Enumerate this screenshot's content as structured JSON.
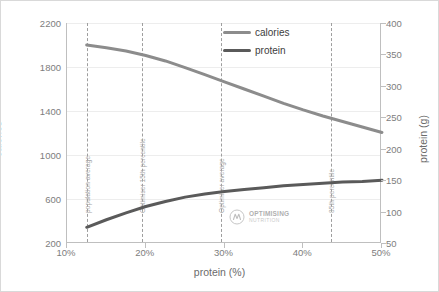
{
  "chart_data": {
    "type": "line",
    "title": "",
    "xlabel": "protein (%)",
    "ylabel": "calories",
    "y2label": "protein (g)",
    "xlim": [
      10,
      50
    ],
    "ylim": [
      200,
      2200
    ],
    "y2lim": [
      50,
      400
    ],
    "grid": true,
    "legend_position": "top-center",
    "x_ticks": [
      "10%",
      "20%",
      "30%",
      "40%",
      "50%"
    ],
    "x_tick_values": [
      10,
      20,
      30,
      40,
      50
    ],
    "y_ticks": [
      "200",
      "600",
      "1000",
      "1400",
      "1800",
      "2200"
    ],
    "y_tick_values": [
      200,
      600,
      1000,
      1400,
      1800,
      2200
    ],
    "y2_ticks": [
      "50",
      "100",
      "150",
      "200",
      "250",
      "300",
      "350",
      "400"
    ],
    "y2_tick_values": [
      50,
      100,
      150,
      200,
      250,
      300,
      350,
      400
    ],
    "series": [
      {
        "name": "calories",
        "axis": "left",
        "color": "#8c8c8c",
        "x": [
          12.5,
          15,
          17.5,
          20,
          22.5,
          25,
          27.5,
          30,
          32.5,
          35,
          37.5,
          40,
          42.5,
          45,
          47.5,
          50
        ],
        "values": [
          2000,
          1975,
          1945,
          1905,
          1855,
          1795,
          1730,
          1665,
          1600,
          1535,
          1470,
          1410,
          1355,
          1305,
          1255,
          1205
        ]
      },
      {
        "name": "protein",
        "axis": "right",
        "color": "#5a5a5a",
        "x": [
          12.5,
          15,
          17.5,
          20,
          22.5,
          25,
          27.5,
          30,
          32.5,
          35,
          37.5,
          40,
          42.5,
          45,
          47.5,
          50
        ],
        "values": [
          75,
          87,
          98,
          108,
          116,
          123,
          128,
          132,
          135,
          138,
          141,
          143,
          145,
          147,
          148,
          150
        ]
      }
    ],
    "annotations": [
      {
        "label": "population average",
        "x": 12.5
      },
      {
        "label": "Optimiser 15th percentile",
        "x": 19.5
      },
      {
        "label": "Optimiser average",
        "x": 29.5
      },
      {
        "label": "85th percentile",
        "x": 43.5
      }
    ]
  },
  "legend": {
    "items": [
      {
        "label": "calories",
        "color": "#8c8c8c"
      },
      {
        "label": "protein",
        "color": "#5a5a5a"
      }
    ]
  },
  "watermark": {
    "main": "OPTIMISING",
    "sub": "NUTRITION"
  }
}
